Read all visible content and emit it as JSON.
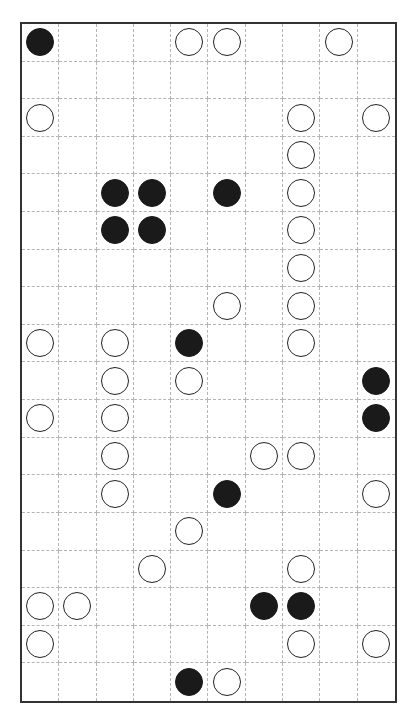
{
  "puzzle": {
    "type": "masyu",
    "cols": 10,
    "rows": 18,
    "colors": {
      "black": "#1a1a1a",
      "white": "#ffffff",
      "grid": "#b5b5b5",
      "border": "#333333"
    },
    "pearls": [
      {
        "r": 0,
        "c": 0,
        "color": "black"
      },
      {
        "r": 0,
        "c": 4,
        "color": "white"
      },
      {
        "r": 0,
        "c": 5,
        "color": "white"
      },
      {
        "r": 0,
        "c": 8,
        "color": "white"
      },
      {
        "r": 2,
        "c": 0,
        "color": "white"
      },
      {
        "r": 2,
        "c": 7,
        "color": "white"
      },
      {
        "r": 2,
        "c": 9,
        "color": "white"
      },
      {
        "r": 3,
        "c": 7,
        "color": "white"
      },
      {
        "r": 4,
        "c": 2,
        "color": "black"
      },
      {
        "r": 4,
        "c": 3,
        "color": "black"
      },
      {
        "r": 4,
        "c": 5,
        "color": "black"
      },
      {
        "r": 4,
        "c": 7,
        "color": "white"
      },
      {
        "r": 5,
        "c": 2,
        "color": "black"
      },
      {
        "r": 5,
        "c": 3,
        "color": "black"
      },
      {
        "r": 5,
        "c": 7,
        "color": "white"
      },
      {
        "r": 6,
        "c": 7,
        "color": "white"
      },
      {
        "r": 7,
        "c": 5,
        "color": "white"
      },
      {
        "r": 7,
        "c": 7,
        "color": "white"
      },
      {
        "r": 8,
        "c": 0,
        "color": "white"
      },
      {
        "r": 8,
        "c": 2,
        "color": "white"
      },
      {
        "r": 8,
        "c": 4,
        "color": "black"
      },
      {
        "r": 8,
        "c": 7,
        "color": "white"
      },
      {
        "r": 9,
        "c": 2,
        "color": "white"
      },
      {
        "r": 9,
        "c": 4,
        "color": "white"
      },
      {
        "r": 9,
        "c": 9,
        "color": "black"
      },
      {
        "r": 10,
        "c": 0,
        "color": "white"
      },
      {
        "r": 10,
        "c": 2,
        "color": "white"
      },
      {
        "r": 10,
        "c": 9,
        "color": "black"
      },
      {
        "r": 11,
        "c": 2,
        "color": "white"
      },
      {
        "r": 11,
        "c": 6,
        "color": "white"
      },
      {
        "r": 11,
        "c": 7,
        "color": "white"
      },
      {
        "r": 12,
        "c": 2,
        "color": "white"
      },
      {
        "r": 12,
        "c": 5,
        "color": "black"
      },
      {
        "r": 12,
        "c": 9,
        "color": "white"
      },
      {
        "r": 13,
        "c": 4,
        "color": "white"
      },
      {
        "r": 14,
        "c": 3,
        "color": "white"
      },
      {
        "r": 14,
        "c": 7,
        "color": "white"
      },
      {
        "r": 15,
        "c": 0,
        "color": "white"
      },
      {
        "r": 15,
        "c": 1,
        "color": "white"
      },
      {
        "r": 15,
        "c": 6,
        "color": "black"
      },
      {
        "r": 15,
        "c": 7,
        "color": "black"
      },
      {
        "r": 16,
        "c": 0,
        "color": "white"
      },
      {
        "r": 16,
        "c": 7,
        "color": "white"
      },
      {
        "r": 16,
        "c": 9,
        "color": "white"
      },
      {
        "r": 17,
        "c": 4,
        "color": "black"
      },
      {
        "r": 17,
        "c": 5,
        "color": "white"
      }
    ]
  }
}
